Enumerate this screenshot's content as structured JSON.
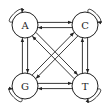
{
  "diagram": {
    "type": "state-transition-graph",
    "stroke_color": "#222222",
    "background": "#ffffff",
    "nodes": [
      {
        "id": "A",
        "label": "A",
        "self_loop": true
      },
      {
        "id": "C",
        "label": "C",
        "self_loop": true
      },
      {
        "id": "G",
        "label": "G",
        "self_loop": true
      },
      {
        "id": "T",
        "label": "T",
        "self_loop": true
      }
    ],
    "edges": [
      {
        "from": "A",
        "to": "C"
      },
      {
        "from": "C",
        "to": "A"
      },
      {
        "from": "G",
        "to": "T"
      },
      {
        "from": "T",
        "to": "G"
      },
      {
        "from": "A",
        "to": "G"
      },
      {
        "from": "G",
        "to": "A"
      },
      {
        "from": "C",
        "to": "T"
      },
      {
        "from": "T",
        "to": "C"
      },
      {
        "from": "A",
        "to": "T"
      },
      {
        "from": "T",
        "to": "A"
      },
      {
        "from": "C",
        "to": "G"
      },
      {
        "from": "G",
        "to": "C"
      }
    ]
  }
}
